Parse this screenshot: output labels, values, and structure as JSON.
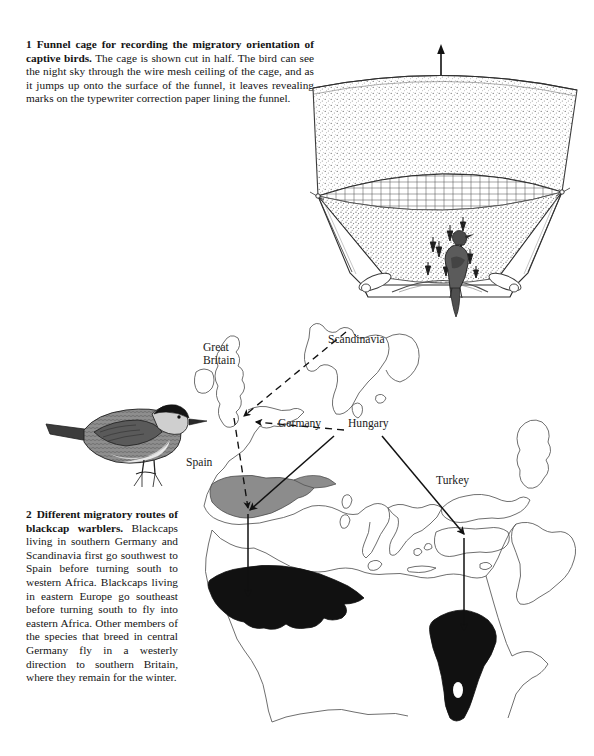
{
  "page": {
    "background_color": "#ffffff",
    "text_color": "#141414"
  },
  "figure1": {
    "number": "1",
    "lead": "Funnel cage for recording the migratory orientation of captive birds.",
    "body": "The cage is shown cut in half. The bird can see the night sky through the wire mesh ceiling of the cage, and as it jumps up onto the surface of the funnel, it leaves revealing marks on the typewriter correction paper lining the funnel.",
    "direction_marker": "S",
    "illustration": "funnel-cage-cutaway"
  },
  "figure2": {
    "number": "2",
    "lead": "Different migratory routes of blackcap warblers.",
    "body": "Blackcaps living in southern Germany and Scandinavia first go southwest to Spain before turning south to western Africa. Blackcaps living in eastern Europe go southeast before turning south to fly into eastern Africa. Other members of the species that breed in central Germany fly in a westerly direction to southern Britain, where they remain for the winter.",
    "illustration": "blackcap-warbler-perched",
    "map": {
      "labels": [
        {
          "id": "great-britain",
          "text": "Great\nBritain"
        },
        {
          "id": "scandinavia",
          "text": "Scandinavia"
        },
        {
          "id": "germany",
          "text": "Germany"
        },
        {
          "id": "hungary",
          "text": "Hungary"
        },
        {
          "id": "spain",
          "text": "Spain"
        },
        {
          "id": "turkey",
          "text": "Turkey"
        }
      ],
      "region_colors": {
        "spain_breeding_shading": "#8c8c8c",
        "wintering_area_fill": "#111111",
        "coastline_stroke": "#555555"
      },
      "routes": [
        {
          "id": "scandinavia-to-britain",
          "style": "dashed",
          "from": "Scandinavia",
          "to": "Great Britain"
        },
        {
          "id": "germany-to-britain",
          "style": "dashed",
          "from": "Germany",
          "to": "Great Britain"
        },
        {
          "id": "britain-to-spain",
          "style": "dashed",
          "from": "Great Britain",
          "to": "Spain"
        },
        {
          "id": "germany-to-spain",
          "style": "solid",
          "from": "Germany",
          "to": "Spain"
        },
        {
          "id": "spain-to-west-africa",
          "style": "solid",
          "from": "Spain",
          "to": "western Africa"
        },
        {
          "id": "hungary-to-turkey",
          "style": "solid",
          "from": "Hungary",
          "to": "Turkey"
        },
        {
          "id": "turkey-to-east-africa",
          "style": "solid",
          "from": "Turkey",
          "to": "eastern Africa"
        }
      ]
    }
  }
}
